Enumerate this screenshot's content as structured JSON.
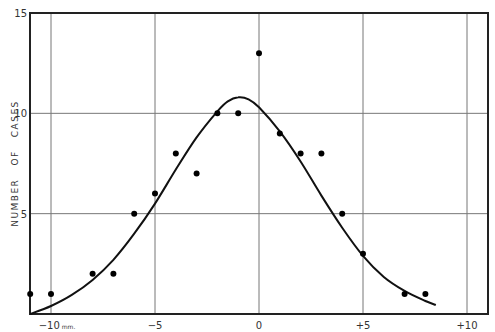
{
  "chart_data": {
    "type": "scatter",
    "title": "",
    "xlabel": "mm",
    "ylabel": "NUMBER   OF   CASES",
    "xlim": [
      -11,
      11.2
    ],
    "ylim": [
      0,
      15
    ],
    "grid": true,
    "legend": null,
    "x_ticks": [
      {
        "value": -10,
        "label": "−10"
      },
      {
        "value": -5,
        "label": "−5"
      },
      {
        "value": 0,
        "label": "0"
      },
      {
        "value": 5,
        "label": "+5"
      },
      {
        "value": 10,
        "label": "+10"
      }
    ],
    "x_unit_label": "mm.",
    "y_ticks": [
      {
        "value": 5,
        "label": "5"
      },
      {
        "value": 10,
        "label": "10"
      },
      {
        "value": 15,
        "label": "15"
      }
    ],
    "series": [
      {
        "name": "observed",
        "kind": "scatter",
        "x": [
          -11,
          -10,
          -8,
          -7,
          -6,
          -5,
          -4,
          -3,
          -2,
          -1,
          0,
          1,
          2,
          3,
          4,
          5,
          7,
          8
        ],
        "y": [
          1,
          1,
          2,
          2,
          5,
          6,
          8,
          7,
          10,
          10,
          13,
          9,
          8,
          8,
          5,
          3,
          1,
          1
        ]
      },
      {
        "name": "fitted curve",
        "kind": "line",
        "x": [
          -11,
          -10,
          -9,
          -8,
          -7,
          -6,
          -5,
          -4,
          -3,
          -2,
          -1.5,
          -1,
          -0.5,
          0,
          1,
          2,
          3,
          4,
          5,
          6,
          7,
          8,
          8.5
        ],
        "y": [
          0,
          0.4,
          0.95,
          1.7,
          2.7,
          4.0,
          5.5,
          7.2,
          8.8,
          10.1,
          10.6,
          10.8,
          10.7,
          10.3,
          9.1,
          7.6,
          5.9,
          4.3,
          2.9,
          1.85,
          1.15,
          0.65,
          0.45
        ]
      }
    ]
  }
}
